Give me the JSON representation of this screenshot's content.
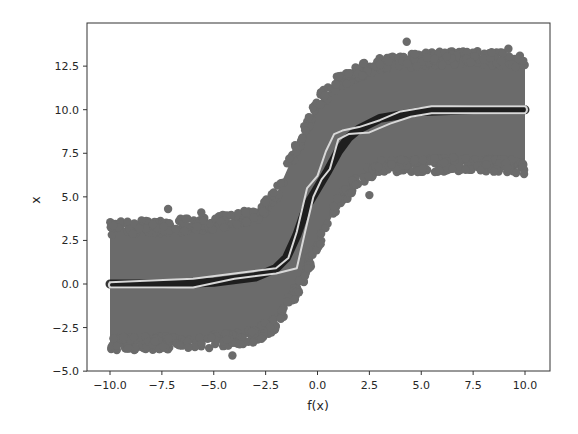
{
  "chart_data": {
    "type": "scatter",
    "title": "",
    "xlabel": "f(x)",
    "ylabel": "x",
    "xlim": [
      -11.0,
      11.1
    ],
    "ylim": [
      -5.0,
      14.9
    ],
    "x_ticks": [
      "−10.0",
      "−7.5",
      "−5.0",
      "−2.5",
      "0.0",
      "2.5",
      "5.0",
      "7.5",
      "10.0"
    ],
    "x_tick_values": [
      -10,
      -7.5,
      -5,
      -2.5,
      0,
      2.5,
      5,
      7.5,
      10
    ],
    "y_ticks": [
      "−5.0",
      "−2.5",
      "0.0",
      "2.5",
      "5.0",
      "7.5",
      "10.0",
      "12.5"
    ],
    "y_tick_values": [
      -5,
      -2.5,
      0,
      2.5,
      5,
      7.5,
      10,
      12.5
    ],
    "grid": false,
    "legend": null,
    "colors": {
      "scatter": "#6b6b6b",
      "dense_core": "#111111",
      "fit_line": "#d8d8d8",
      "axes": "#333333"
    },
    "series": [
      {
        "name": "noisy samples (sigmoid-like step, noise ±~3.5)",
        "kind": "scatter",
        "band_x": [
          -10,
          -7.5,
          -5,
          -3,
          -2,
          -1,
          0,
          1,
          2,
          3,
          5,
          7.5,
          10
        ],
        "band_lower": [
          -3.8,
          -3.8,
          -3.7,
          -3.4,
          -2.6,
          -0.8,
          1.8,
          4.2,
          5.7,
          6.3,
          6.4,
          6.5,
          6.3
        ],
        "band_upper": [
          3.6,
          3.7,
          3.9,
          4.3,
          5.5,
          8.2,
          10.8,
          12.0,
          12.6,
          13.0,
          13.3,
          13.4,
          13.2
        ],
        "outliers": [
          [
            -7.2,
            4.3
          ],
          [
            -5.6,
            4.1
          ],
          [
            -4.1,
            -4.1
          ],
          [
            4.3,
            13.9
          ],
          [
            4.7,
            13.2
          ],
          [
            9.2,
            13.5
          ],
          [
            2.5,
            5.1
          ]
        ]
      },
      {
        "name": "true function (dark)",
        "kind": "line",
        "x": [
          -10,
          -7.5,
          -5,
          -3,
          -2,
          -1.5,
          -1,
          -0.5,
          0,
          0.5,
          1,
          1.5,
          2,
          3,
          5,
          7.5,
          10
        ],
        "y": [
          0.0,
          0.0,
          0.1,
          0.4,
          0.9,
          1.5,
          2.8,
          4.5,
          5.5,
          6.5,
          7.6,
          8.4,
          8.9,
          9.5,
          9.9,
          10.0,
          10.0
        ]
      },
      {
        "name": "fitted upper curve (white)",
        "kind": "line",
        "x": [
          -10,
          -6,
          -4,
          -2,
          -1.4,
          -1,
          -0.5,
          0,
          0.4,
          0.8,
          1.2,
          2,
          3,
          4,
          5.5,
          7.5,
          10
        ],
        "y": [
          0.1,
          0.3,
          0.6,
          0.9,
          1.5,
          3.0,
          5.5,
          6.2,
          7.6,
          8.6,
          8.8,
          9.0,
          9.4,
          9.9,
          10.2,
          10.2,
          10.2
        ]
      },
      {
        "name": "fitted lower curve (white)",
        "kind": "line",
        "x": [
          -10,
          -6,
          -4,
          -2,
          -1,
          -0.6,
          -0.2,
          0.2,
          0.6,
          1,
          1.5,
          2.5,
          3.5,
          4.5,
          5.5,
          7.5,
          10
        ],
        "y": [
          -0.2,
          -0.2,
          0.3,
          0.6,
          0.9,
          3.0,
          5.0,
          6.0,
          6.6,
          8.3,
          8.6,
          8.7,
          9.2,
          9.6,
          9.8,
          9.8,
          9.8
        ]
      }
    ]
  }
}
